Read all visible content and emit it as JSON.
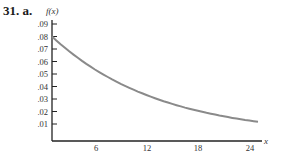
{
  "problem": {
    "number": "31.",
    "part": "a."
  },
  "chart_data": {
    "type": "line",
    "title": "",
    "xlabel": "x",
    "ylabel": "f(x)",
    "xlim": [
      0,
      24
    ],
    "ylim": [
      0,
      0.09
    ],
    "xticks": [
      6,
      12,
      18,
      24
    ],
    "xtick_labels": [
      "6",
      "12",
      "18",
      "24"
    ],
    "yticks": [
      0.01,
      0.02,
      0.03,
      0.04,
      0.05,
      0.06,
      0.07,
      0.08,
      0.09
    ],
    "ytick_labels": [
      ".01",
      ".02",
      ".03",
      ".04",
      ".05",
      ".06",
      ".07",
      ".08",
      ".09"
    ],
    "grid": false,
    "legend": null,
    "series": [
      {
        "name": "f(x)",
        "description": "exponential decay, f(x) = 0.08 e^(-0.08x)",
        "x": [
          0,
          3,
          6,
          9,
          12,
          15,
          18,
          21,
          24
        ],
        "values": [
          0.08,
          0.0629,
          0.0495,
          0.0389,
          0.0306,
          0.0241,
          0.019,
          0.0149,
          0.0117
        ]
      }
    ],
    "color": "#8a8a8a"
  }
}
